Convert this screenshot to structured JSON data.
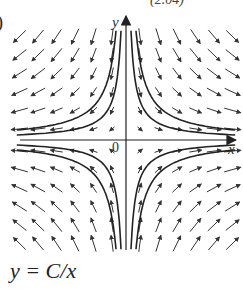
{
  "figure": {
    "part_label": ")",
    "top_partial_text": "(2.04)",
    "axis_labels": {
      "x": "x",
      "y": "y",
      "origin": "0"
    },
    "caption": "y = C/x"
  },
  "chart_data": {
    "type": "direction-field",
    "title": "",
    "equation": "y = C/x",
    "xlabel": "x",
    "ylabel": "y",
    "origin_label": "0",
    "grid": {
      "cols_per_side": 6,
      "rows_per_side": 6
    },
    "solution_curves": [
      {
        "quadrant": "I",
        "C": 1
      },
      {
        "quadrant": "I",
        "C": 2
      },
      {
        "quadrant": "II",
        "C": -1
      },
      {
        "quadrant": "II",
        "C": -2
      },
      {
        "quadrant": "III",
        "C": 1
      },
      {
        "quadrant": "III",
        "C": 2
      },
      {
        "quadrant": "IV",
        "C": -1
      },
      {
        "quadrant": "IV",
        "C": -2
      }
    ],
    "arrow_direction_rule": "slope = -y/x; arrows point outward along x near x-axis, toward x-axis from above, away in lower half"
  }
}
